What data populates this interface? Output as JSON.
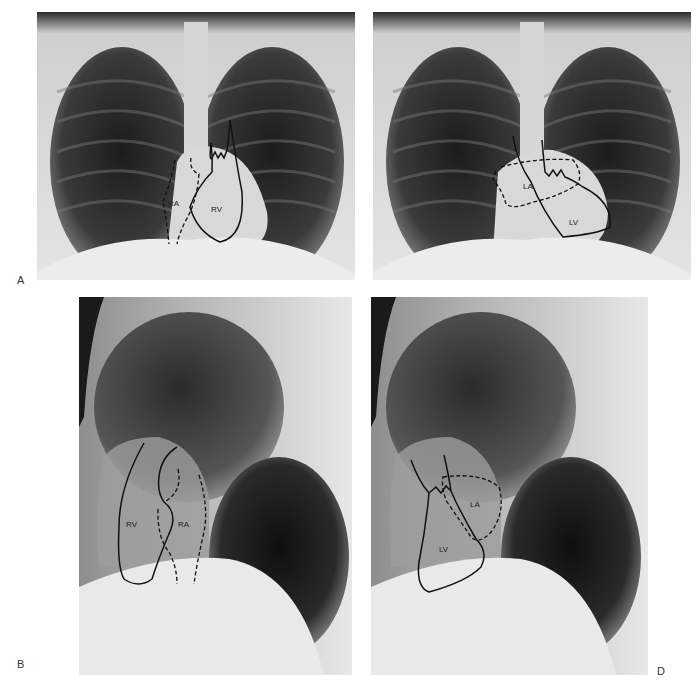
{
  "figure": {
    "panels": [
      {
        "id": "A",
        "view": "Frontal (PA) chest radiograph",
        "outlines": [
          {
            "label": "RA",
            "style": "dashed"
          },
          {
            "label": "RV",
            "style": "solid"
          }
        ]
      },
      {
        "id": "C",
        "view": "Frontal (PA) chest radiograph",
        "outlines": [
          {
            "label": "LA",
            "style": "dashed"
          },
          {
            "label": "LV",
            "style": "solid"
          }
        ]
      },
      {
        "id": "B",
        "view": "Lateral chest radiograph",
        "outlines": [
          {
            "label": "RV",
            "style": "solid"
          },
          {
            "label": "RA",
            "style": "dashed"
          }
        ]
      },
      {
        "id": "D",
        "view": "Lateral chest radiograph",
        "outlines": [
          {
            "label": "LA",
            "style": "dashed"
          },
          {
            "label": "LV",
            "style": "solid"
          }
        ]
      }
    ],
    "letters": {
      "a": "A",
      "b": "B",
      "d": "D"
    },
    "labels": {
      "a_ra": "RA",
      "a_rv": "RV",
      "c_la": "LA",
      "c_lv": "LV",
      "b_rv": "RV",
      "b_ra": "RA",
      "d_la": "LA",
      "d_lv": "LV"
    }
  }
}
